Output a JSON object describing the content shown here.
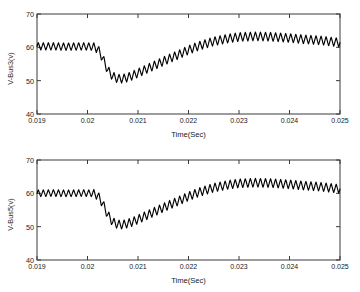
{
  "figure": {
    "background": "#ffffff",
    "line_color": "#000000",
    "axis_color": "#333333",
    "text_color": "#1a1a1a"
  },
  "panels": [
    {
      "name": "v-bus3-panel",
      "ylabel": "V-Bus3(v)",
      "xlabel": "Time(Sec)",
      "yticks": [
        "70",
        "60",
        "50",
        "40"
      ],
      "xticks": [
        "0.019",
        "0.02",
        "0.021",
        "0.022",
        "0.023",
        "0.024",
        "0.025"
      ]
    },
    {
      "name": "v-bus5-panel",
      "ylabel": "V-Bus5(v)",
      "xlabel": "Time(Sec)",
      "yticks": [
        "70",
        "60",
        "50",
        "40"
      ],
      "xticks": [
        "0.019",
        "0.02",
        "0.021",
        "0.022",
        "0.023",
        "0.024",
        "0.025"
      ]
    }
  ],
  "chart_data": [
    {
      "type": "line",
      "title": "",
      "xlabel": "Time(Sec)",
      "ylabel": "V-Bus3(v)",
      "xlim": [
        0.019,
        0.025
      ],
      "ylim": [
        40,
        70
      ],
      "xticks": [
        0.019,
        0.02,
        0.021,
        0.022,
        0.023,
        0.024,
        0.025
      ],
      "yticks": [
        40,
        50,
        60,
        70
      ],
      "grid": false,
      "legend": "none",
      "line_color": "#000000",
      "description": "Bus 3 RMS voltage showing a sag starting at t=0.0202 s, minimum near 50 V around t=0.0205 s, recovery to about 63 V by t=0.0230 s, with a high-frequency ripple of about +/-1.3 V riding on the envelope.",
      "ripple": {
        "cycles_across_span": 60,
        "amplitude_volts": 1.3,
        "amplitude_volts_prefault": 1.1
      },
      "envelope": {
        "x": [
          0.019,
          0.0193,
          0.0196,
          0.0199,
          0.0201,
          0.0202,
          0.0203,
          0.0204,
          0.0205,
          0.0206,
          0.0207,
          0.0208,
          0.0209,
          0.021,
          0.0212,
          0.0214,
          0.0216,
          0.0218,
          0.022,
          0.0222,
          0.0225,
          0.0228,
          0.023,
          0.0233,
          0.0236,
          0.024,
          0.0243,
          0.0246,
          0.0249,
          0.025
        ],
        "y": [
          60.3,
          60.3,
          60.2,
          60.3,
          60.2,
          59.6,
          56.8,
          53.2,
          51.3,
          50.6,
          50.6,
          51.0,
          51.6,
          52.3,
          53.7,
          55.1,
          56.5,
          57.8,
          59.2,
          60.4,
          61.8,
          62.7,
          63.1,
          63.3,
          63.2,
          62.8,
          62.4,
          62.1,
          61.6,
          61.4
        ]
      }
    },
    {
      "type": "line",
      "title": "",
      "xlabel": "Time(Sec)",
      "ylabel": "V-Bus5(v)",
      "xlim": [
        0.019,
        0.025
      ],
      "ylim": [
        40,
        70
      ],
      "xticks": [
        0.019,
        0.02,
        0.021,
        0.022,
        0.023,
        0.024,
        0.025
      ],
      "yticks": [
        40,
        50,
        60,
        70
      ],
      "grid": false,
      "legend": "none",
      "line_color": "#000000",
      "description": "Bus 5 RMS voltage with essentially the same sag profile as Bus 3: pre-fault near 60 V, dip to about 50 V near t=0.0206 s, recovery to roughly 63 V by t=0.0230 s, with high-frequency ripple.",
      "ripple": {
        "cycles_across_span": 60,
        "amplitude_volts": 1.3,
        "amplitude_volts_prefault": 1.0
      },
      "envelope": {
        "x": [
          0.019,
          0.0193,
          0.0196,
          0.0199,
          0.0201,
          0.0202,
          0.0203,
          0.0204,
          0.0205,
          0.0206,
          0.0207,
          0.0208,
          0.0209,
          0.021,
          0.0212,
          0.0214,
          0.0216,
          0.0218,
          0.022,
          0.0222,
          0.0225,
          0.0228,
          0.023,
          0.0233,
          0.0236,
          0.024,
          0.0243,
          0.0246,
          0.0249,
          0.025
        ],
        "y": [
          60.0,
          60.1,
          60.0,
          60.1,
          60.0,
          59.4,
          57.0,
          53.6,
          51.4,
          50.7,
          50.6,
          51.0,
          51.5,
          52.2,
          53.6,
          55.0,
          56.4,
          57.7,
          59.1,
          60.3,
          61.7,
          62.6,
          63.0,
          63.2,
          63.1,
          62.7,
          62.3,
          62.0,
          61.5,
          61.3
        ]
      }
    }
  ]
}
